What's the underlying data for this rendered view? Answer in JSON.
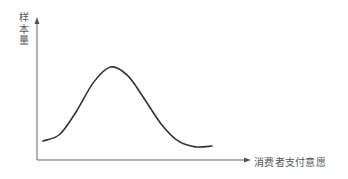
{
  "chart_data": {
    "type": "line",
    "title": "",
    "xlabel": "消费者支付意愿",
    "ylabel": "样本量",
    "ylabel_chars": [
      "样",
      "本",
      "量"
    ],
    "grid": false,
    "legend": null,
    "x_ticks": [],
    "y_ticks": [],
    "series": [
      {
        "name": "样本量分布",
        "description": "bell-shaped curve, rises from low at left, peaks near 40% of range, falls to near-baseline at right",
        "x": [
          0,
          10,
          20,
          30,
          40,
          50,
          60,
          70,
          80,
          90,
          100
        ],
        "values": [
          12,
          20,
          48,
          82,
          100,
          90,
          62,
          32,
          12,
          5,
          6
        ]
      }
    ],
    "colors": {
      "curve": "#333333",
      "axes": "#666666",
      "text": "#555555"
    }
  }
}
